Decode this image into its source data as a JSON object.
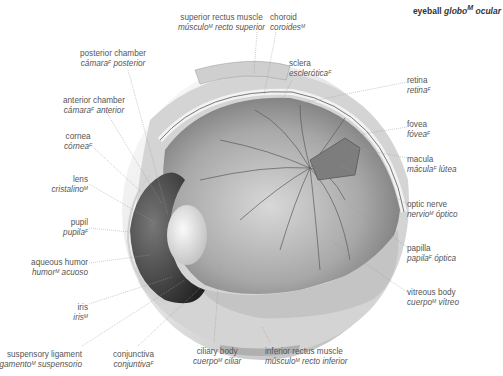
{
  "title": {
    "en": "eyeball",
    "es": "globo",
    "es_gender": "M",
    "es_rest": " ocular"
  },
  "labels": [
    {
      "id": "superior-rectus-muscle",
      "en": "superior rectus muscle",
      "es_pre": "músculo",
      "gender": "M",
      "es_post": " recto superior"
    },
    {
      "id": "choroid",
      "en": "choroid",
      "es_pre": "coroides",
      "gender": "M",
      "es_post": ""
    },
    {
      "id": "sclera",
      "en": "sclera",
      "es_pre": "esclerótica",
      "gender": "F",
      "es_post": ""
    },
    {
      "id": "posterior-chamber",
      "en": "posterior chamber",
      "es_pre": "cámara",
      "gender": "F",
      "es_post": " posterior"
    },
    {
      "id": "anterior-chamber",
      "en": "anterior chamber",
      "es_pre": "cámara",
      "gender": "F",
      "es_post": " anterior"
    },
    {
      "id": "cornea",
      "en": "cornea",
      "es_pre": "córnea",
      "gender": "F",
      "es_post": ""
    },
    {
      "id": "lens",
      "en": "lens",
      "es_pre": "cristalino",
      "gender": "M",
      "es_post": ""
    },
    {
      "id": "pupil",
      "en": "pupil",
      "es_pre": "pupila",
      "gender": "F",
      "es_post": ""
    },
    {
      "id": "aqueous-humor",
      "en": "aqueous humor",
      "es_pre": "humor",
      "gender": "M",
      "es_post": " acuoso"
    },
    {
      "id": "iris",
      "en": "iris",
      "es_pre": "iris",
      "gender": "M",
      "es_post": ""
    },
    {
      "id": "suspensory-ligament",
      "en": "suspensory ligament",
      "es_pre": "ligamento",
      "gender": "M",
      "es_post": " suspensorio"
    },
    {
      "id": "conjunctiva",
      "en": "conjunctiva",
      "es_pre": "conjuntiva",
      "gender": "F",
      "es_post": ""
    },
    {
      "id": "ciliary-body",
      "en": "ciliary body",
      "es_pre": "cuerpo",
      "gender": "M",
      "es_post": " ciliar"
    },
    {
      "id": "inferior-rectus-muscle",
      "en": "inferior rectus muscle",
      "es_pre": "músculo",
      "gender": "M",
      "es_post": " recto inferior"
    },
    {
      "id": "retina",
      "en": "retina",
      "es_pre": "retina",
      "gender": "F",
      "es_post": ""
    },
    {
      "id": "fovea",
      "en": "fovea",
      "es_pre": "fóvea",
      "gender": "F",
      "es_post": ""
    },
    {
      "id": "macula",
      "en": "macula",
      "es_pre": "mácula",
      "gender": "F",
      "es_post": " lútea"
    },
    {
      "id": "optic-nerve",
      "en": "optic nerve",
      "es_pre": "nervio",
      "gender": "M",
      "es_post": " óptico"
    },
    {
      "id": "papilla",
      "en": "papilla",
      "es_pre": "papila",
      "gender": "F",
      "es_post": " óptica"
    },
    {
      "id": "vitreous-body",
      "en": "vitreous body",
      "es_pre": "cuerpo",
      "gender": "M",
      "es_post": " vítreo"
    }
  ],
  "colors": {
    "leader": "#9a9a9a",
    "text": "#555555",
    "eye_dark": "#3a3a3a",
    "eye_mid": "#8c8c8c",
    "eye_light": "#e6e6e6"
  }
}
